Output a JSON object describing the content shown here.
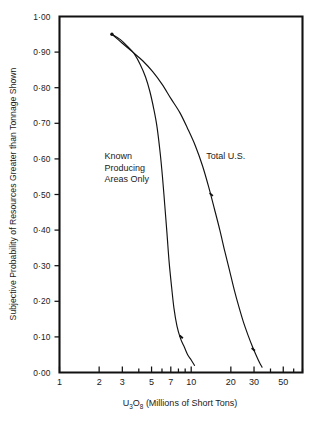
{
  "chart_data": {
    "type": "line",
    "title": "",
    "xlabel": "U3O8 (Millions of Short Tons)",
    "xlabel_parts": {
      "prefix": "U",
      "sub1": "3",
      "mid": "O",
      "sub2": "8",
      "suffix": " (Millions of Short Tons)"
    },
    "ylabel": "Subjective Probability of Resources Greater than Tonnage Shown",
    "xscale": "log",
    "yscale": "linear",
    "xlim": [
      1,
      70
    ],
    "ylim": [
      0.0,
      1.0
    ],
    "grid": false,
    "legend_position": "inline-annotations",
    "x_ticks": [
      1,
      2,
      3,
      4,
      5,
      6,
      7,
      8,
      9,
      10,
      20,
      30,
      40,
      50,
      60,
      70
    ],
    "x_tick_labels": [
      {
        "value": 1,
        "label": "1"
      },
      {
        "value": 2,
        "label": "2"
      },
      {
        "value": 3,
        "label": "3"
      },
      {
        "value": 5,
        "label": "5"
      },
      {
        "value": 7,
        "label": "7"
      },
      {
        "value": 10,
        "label": "10"
      },
      {
        "value": 20,
        "label": "20"
      },
      {
        "value": 30,
        "label": "30"
      },
      {
        "value": 50,
        "label": "50"
      }
    ],
    "y_ticks": [
      0.0,
      0.1,
      0.2,
      0.3,
      0.4,
      0.5,
      0.6,
      0.7,
      0.8,
      0.9,
      1.0
    ],
    "y_tick_labels": [
      {
        "value": 1.0,
        "label": "1·00"
      },
      {
        "value": 0.9,
        "label": "0·90"
      },
      {
        "value": 0.8,
        "label": "0·80"
      },
      {
        "value": 0.7,
        "label": "0·70"
      },
      {
        "value": 0.6,
        "label": "0·60"
      },
      {
        "value": 0.5,
        "label": "0·50"
      },
      {
        "value": 0.4,
        "label": "0·40"
      },
      {
        "value": 0.3,
        "label": "0·30"
      },
      {
        "value": 0.2,
        "label": "0·20"
      },
      {
        "value": 0.1,
        "label": "0·10"
      },
      {
        "value": 0.0,
        "label": "0·00"
      }
    ],
    "series": [
      {
        "name": "Known Producing Areas Only",
        "label_lines": [
          "Known",
          "Producing",
          "Areas Only"
        ],
        "color": "#111111",
        "points": [
          {
            "x": 2.5,
            "y": 0.95
          },
          {
            "x": 2.9,
            "y": 0.935
          },
          {
            "x": 3.3,
            "y": 0.915
          },
          {
            "x": 3.7,
            "y": 0.895
          },
          {
            "x": 4.1,
            "y": 0.865
          },
          {
            "x": 4.5,
            "y": 0.83
          },
          {
            "x": 4.85,
            "y": 0.79
          },
          {
            "x": 5.2,
            "y": 0.74
          },
          {
            "x": 5.5,
            "y": 0.69
          },
          {
            "x": 5.8,
            "y": 0.62
          },
          {
            "x": 6.05,
            "y": 0.55
          },
          {
            "x": 6.3,
            "y": 0.47
          },
          {
            "x": 6.55,
            "y": 0.39
          },
          {
            "x": 6.8,
            "y": 0.31
          },
          {
            "x": 7.1,
            "y": 0.24
          },
          {
            "x": 7.4,
            "y": 0.18
          },
          {
            "x": 7.8,
            "y": 0.13
          },
          {
            "x": 8.3,
            "y": 0.095
          },
          {
            "x": 8.9,
            "y": 0.07
          },
          {
            "x": 9.4,
            "y": 0.05
          },
          {
            "x": 10.0,
            "y": 0.035
          },
          {
            "x": 10.6,
            "y": 0.02
          }
        ],
        "markers": [
          {
            "x": 8.4,
            "y": 0.1
          }
        ]
      },
      {
        "name": "Total U.S.",
        "label_lines": [
          "Total U.S."
        ],
        "color": "#111111",
        "points": [
          {
            "x": 2.5,
            "y": 0.95
          },
          {
            "x": 3.0,
            "y": 0.925
          },
          {
            "x": 3.6,
            "y": 0.9
          },
          {
            "x": 4.3,
            "y": 0.875
          },
          {
            "x": 5.1,
            "y": 0.845
          },
          {
            "x": 6.0,
            "y": 0.81
          },
          {
            "x": 7.0,
            "y": 0.77
          },
          {
            "x": 8.2,
            "y": 0.73
          },
          {
            "x": 9.4,
            "y": 0.685
          },
          {
            "x": 10.8,
            "y": 0.635
          },
          {
            "x": 12.2,
            "y": 0.58
          },
          {
            "x": 13.6,
            "y": 0.52
          },
          {
            "x": 15.0,
            "y": 0.46
          },
          {
            "x": 16.5,
            "y": 0.4
          },
          {
            "x": 18.0,
            "y": 0.34
          },
          {
            "x": 19.6,
            "y": 0.285
          },
          {
            "x": 21.3,
            "y": 0.23
          },
          {
            "x": 23.0,
            "y": 0.185
          },
          {
            "x": 25.0,
            "y": 0.14
          },
          {
            "x": 27.0,
            "y": 0.105
          },
          {
            "x": 29.0,
            "y": 0.075
          },
          {
            "x": 31.0,
            "y": 0.05
          },
          {
            "x": 33.0,
            "y": 0.028
          },
          {
            "x": 34.5,
            "y": 0.015
          }
        ],
        "markers": [
          {
            "x": 14.2,
            "y": 0.5
          },
          {
            "x": 29.6,
            "y": 0.065
          }
        ]
      }
    ],
    "annotations": [
      {
        "name": "known-producing-areas-label",
        "text": "Known Producing Areas Only",
        "lines": [
          "Known",
          "Producing",
          "Areas Only"
        ],
        "x": 2.2,
        "y": 0.6
      },
      {
        "name": "total-us-label",
        "text": "Total U.S.",
        "lines": [
          "Total U.S."
        ],
        "x": 13.0,
        "y": 0.6
      }
    ]
  }
}
